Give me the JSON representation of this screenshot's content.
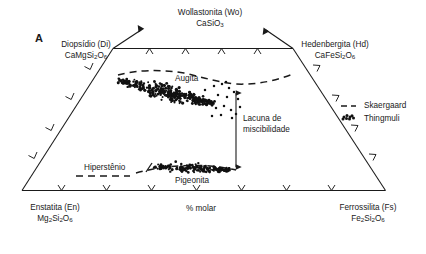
{
  "figure": {
    "panel_letter": "A",
    "axis_caption": "% molar"
  },
  "vertices": {
    "top_apex": {
      "name": "Wollastonita (Wo)",
      "formula_text": "CaSiO3",
      "formula_parts": [
        {
          "t": "CaSiO"
        },
        {
          "t": "3",
          "sub": true
        }
      ]
    },
    "top_left": {
      "name": "Diopsídio (Di)",
      "formula_parts": [
        {
          "t": "CaMgSi"
        },
        {
          "t": "2",
          "sub": true
        },
        {
          "t": "O"
        },
        {
          "t": "6",
          "sub": true
        }
      ]
    },
    "top_right": {
      "name": "Hedenbergita (Hd)",
      "formula_parts": [
        {
          "t": "CaFeSi"
        },
        {
          "t": "2",
          "sub": true
        },
        {
          "t": "O"
        },
        {
          "t": "6",
          "sub": true
        }
      ]
    },
    "bottom_left": {
      "name": "Enstatita (En)",
      "formula_parts": [
        {
          "t": "Mg"
        },
        {
          "t": "2",
          "sub": true
        },
        {
          "t": "Si"
        },
        {
          "t": "2",
          "sub": true
        },
        {
          "t": "O"
        },
        {
          "t": "6",
          "sub": true
        }
      ]
    },
    "bottom_right": {
      "name": "Ferrossilita (Fs)",
      "formula_parts": [
        {
          "t": "Fe"
        },
        {
          "t": "2",
          "sub": true
        },
        {
          "t": "Si"
        },
        {
          "t": "2",
          "sub": true
        },
        {
          "t": "O"
        },
        {
          "t": "6",
          "sub": true
        }
      ]
    }
  },
  "field_labels": {
    "augite": "Augita",
    "pigeonite": "Pigeonita",
    "hypersthene": "Hiperstênio",
    "miscibility_gap_line1": "Lacuna de",
    "miscibility_gap_line2": "miscibilidade"
  },
  "legend": {
    "items": [
      {
        "label": "Skaergaard",
        "marker": "dashed-line"
      },
      {
        "label": "Thingmuli",
        "marker": "dot-cluster"
      }
    ]
  },
  "colors": {
    "line": "#1a1a1a",
    "text": "#1a1a1a",
    "dots": "#111111",
    "background": "#ffffff"
  },
  "chart_data": {
    "type": "scatter",
    "title": "",
    "xlabel": "% molar",
    "ylabel": "",
    "diagram": "pyroxene quadrilateral (truncated Wo-En-Fs ternary)",
    "grid": false,
    "legend_position": "right",
    "axis_ranges": {
      "wo_top_percent": 50,
      "en_fs_bottom": [
        0,
        100
      ]
    },
    "tick_counts": {
      "top": 4,
      "bottom": 7,
      "left_side": 3,
      "right_side": 3
    },
    "series": [
      {
        "name": "Skaergaard",
        "type": "trend-line",
        "style": "dashed",
        "paths": [
          {
            "id": "augite-trend-upper",
            "points": [
              [
                120,
                74
              ],
              [
                142,
                71
              ],
              [
                170,
                71
              ],
              [
                196,
                75
              ],
              [
                214,
                80
              ],
              [
                233,
                83
              ],
              [
                258,
                83
              ],
              [
                276,
                79
              ],
              [
                292,
                75
              ]
            ]
          },
          {
            "id": "pigeonite-trend-lower",
            "points": [
              [
                133,
                172
              ],
              [
                160,
                167
              ],
              [
                186,
                165
              ],
              [
                212,
                166
              ],
              [
                232,
                169
              ]
            ]
          },
          {
            "id": "hypersthene-trend",
            "points": [
              [
                78,
                176
              ],
              [
                96,
                176
              ],
              [
                114,
                176
              ],
              [
                128,
                176
              ]
            ]
          }
        ]
      },
      {
        "name": "Thingmuli",
        "type": "scatter-cloud",
        "marker": "filled-circle",
        "clouds": [
          {
            "id": "augite-cloud",
            "description": "dense elongated band trending down-right",
            "n_points": 300,
            "bbox": [
              112,
              76,
              232,
              112
            ],
            "axis_start": [
              118,
              80
            ],
            "axis_end": [
              214,
              104
            ],
            "band_halfwidth": 6
          },
          {
            "id": "augite-scatter-tail",
            "description": "sparse outlier points to the right of main band",
            "n_points": 18,
            "bbox": [
              208,
              82,
              240,
              118
            ],
            "points": [
              [
                214,
                86
              ],
              [
                222,
                84
              ],
              [
                229,
                88
              ],
              [
                218,
                95
              ],
              [
                227,
                97
              ],
              [
                234,
                92
              ],
              [
                209,
                101
              ],
              [
                216,
                108
              ],
              [
                224,
                106
              ],
              [
                231,
                110
              ],
              [
                238,
                99
              ],
              [
                212,
                116
              ],
              [
                221,
                115
              ],
              [
                232,
                118
              ],
              [
                205,
                90
              ],
              [
                240,
                107
              ],
              [
                226,
                82
              ],
              [
                236,
                114
              ]
            ]
          },
          {
            "id": "pigeonite-cloud",
            "description": "narrow horizontal dense band along pigeonite trend",
            "n_points": 140,
            "bbox": [
              150,
              160,
              236,
              176
            ],
            "axis_start": [
              154,
              167
            ],
            "axis_end": [
              230,
              170
            ],
            "band_halfwidth": 4
          }
        ]
      }
    ],
    "annotations": [
      {
        "text": "Augita",
        "at": [
          196,
          79
        ],
        "type": "field-label"
      },
      {
        "text": "Pigeonita",
        "at": [
          200,
          182
        ],
        "type": "field-label"
      },
      {
        "text": "Hiperstênio",
        "at": [
          110,
          168
        ],
        "type": "field-label"
      },
      {
        "text": "Lacuna de miscibilidade",
        "at": [
          243,
          122
        ],
        "type": "gap-annotation",
        "arrow": {
          "from": [
            236,
            88
          ],
          "to": [
            236,
            172
          ],
          "double_headed": true
        }
      }
    ]
  }
}
